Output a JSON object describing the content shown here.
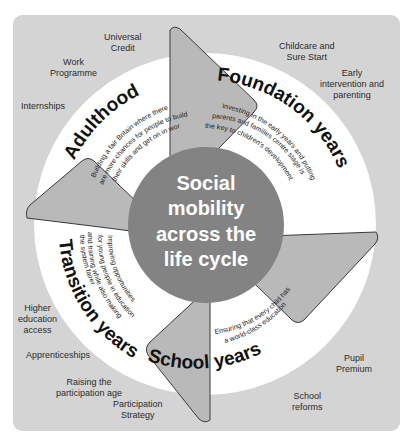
{
  "colors": {
    "background": "#ffffff",
    "panel": "#d4d4d4",
    "ring": "#ffffff",
    "center": "#838383",
    "arrow_fill": "#b9b9b9",
    "arrow_stroke": "#3a3a3a",
    "text_dark": "#111111",
    "text_light": "#ffffff",
    "policy_text": "#2b2b2b"
  },
  "center": {
    "lines": [
      "Social",
      "mobility",
      "across the",
      "life cycle"
    ]
  },
  "stages": [
    {
      "title": "Foundation years",
      "description": [
        "Investing in the early years and putting",
        "parents and families centre stage is",
        "the key to children's development"
      ],
      "policies": [
        {
          "label": [
            "Childcare and",
            "Sure Start"
          ]
        },
        {
          "label": [
            "Early",
            "intervention and",
            "parenting"
          ]
        }
      ]
    },
    {
      "title": "School years",
      "description": [
        "Ensuring that every child has",
        "a world-class education"
      ],
      "policies": [
        {
          "label": [
            "Pupil",
            "Premium"
          ]
        },
        {
          "label": [
            "School",
            "reforms"
          ]
        }
      ]
    },
    {
      "title": "Transition years",
      "description": [
        "Improving opportunities",
        "for young people in education",
        "and training while also making",
        "the system fairer"
      ],
      "policies": [
        {
          "label": [
            "Higher",
            "education",
            "access"
          ]
        },
        {
          "label": [
            "Apprenticeships"
          ]
        },
        {
          "label": [
            "Raising the",
            "participation age"
          ]
        },
        {
          "label": [
            "Participation",
            "Strategy"
          ]
        }
      ]
    },
    {
      "title": "Adulthood",
      "description": [
        "Building a fair Britain where there",
        "are more chances for people to build",
        "their skills and get on in work"
      ],
      "policies": [
        {
          "label": [
            "Universal",
            "Credit"
          ]
        },
        {
          "label": [
            "Work",
            "Programme"
          ]
        },
        {
          "label": [
            "Internships"
          ]
        }
      ]
    }
  ]
}
